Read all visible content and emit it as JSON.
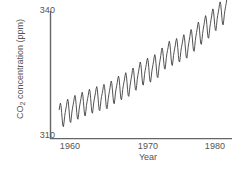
{
  "chart_data": {
    "type": "line",
    "title": "",
    "xlabel": "Year",
    "ylabel_prefix": "CO",
    "ylabel_sub": "2",
    "ylabel_suffix": " concentration (ppm)",
    "ylabel_full": "CO2 concentration (ppm)",
    "xlim": [
      1957.0,
      1982.0
    ],
    "ylim": [
      310,
      340
    ],
    "xticks": [
      1960,
      1970,
      1980
    ],
    "xtick_labels": [
      "1960",
      "1970",
      "1980"
    ],
    "yticks": [
      310,
      340
    ],
    "ytick_labels": [
      "310",
      "340"
    ],
    "grid": false,
    "legend": "none",
    "line_color": "#3f3f3f",
    "line_width": 0.9,
    "axis_color": "#666666",
    "background": "#ffffff",
    "series_name": "Mauna Loa atmospheric CO2",
    "trend_start_ppm": 314.5,
    "trend_end_ppm": 338.5,
    "seasonal_amplitude_ppm": 3.0,
    "seasonal_peak_month": 5,
    "x_start": 1958.2,
    "x_end": 1981.4,
    "points_per_year": 12,
    "annual_means": [
      {
        "year": 1958,
        "value": 315.0
      },
      {
        "year": 1959,
        "value": 315.9
      },
      {
        "year": 1960,
        "value": 316.9
      },
      {
        "year": 1961,
        "value": 317.6
      },
      {
        "year": 1962,
        "value": 318.4
      },
      {
        "year": 1963,
        "value": 319.0
      },
      {
        "year": 1964,
        "value": 319.6
      },
      {
        "year": 1965,
        "value": 320.0
      },
      {
        "year": 1966,
        "value": 321.4
      },
      {
        "year": 1967,
        "value": 322.2
      },
      {
        "year": 1968,
        "value": 323.0
      },
      {
        "year": 1969,
        "value": 324.6
      },
      {
        "year": 1970,
        "value": 325.7
      },
      {
        "year": 1971,
        "value": 326.3
      },
      {
        "year": 1972,
        "value": 327.5
      },
      {
        "year": 1973,
        "value": 329.7
      },
      {
        "year": 1974,
        "value": 330.2
      },
      {
        "year": 1975,
        "value": 331.1
      },
      {
        "year": 1976,
        "value": 332.0
      },
      {
        "year": 1977,
        "value": 333.8
      },
      {
        "year": 1978,
        "value": 335.4
      },
      {
        "year": 1979,
        "value": 336.8
      },
      {
        "year": 1980,
        "value": 338.7
      },
      {
        "year": 1981,
        "value": 339.9
      }
    ],
    "monthly_seasonal_offsets": [
      0.25,
      0.95,
      1.65,
      2.55,
      3.0,
      2.3,
      0.7,
      -1.2,
      -2.6,
      -2.9,
      -1.9,
      -0.6
    ]
  }
}
